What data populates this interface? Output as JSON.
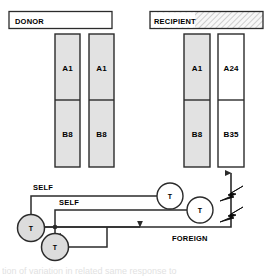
{
  "figure": {
    "type": "immunology-diagram",
    "title_donor": "DONOR",
    "title_recipient": "RECIPIENT",
    "caption_partial": "tion of variation in related same  response  to"
  },
  "panels": [
    {
      "id": "donor",
      "header": "DONOR",
      "header_fill": "#ffffff",
      "header_hatched": false,
      "columns": [
        {
          "id": "donor-col-1",
          "top_label": "A1",
          "bottom_label": "B8",
          "fill": "#e2e2e2"
        },
        {
          "id": "donor-col-2",
          "top_label": "A1",
          "bottom_label": "B8",
          "fill": "#e2e2e2"
        }
      ]
    },
    {
      "id": "recipient",
      "header": "RECIPIENT",
      "header_fill": "#f2f2f2",
      "header_hatched": true,
      "columns": [
        {
          "id": "recipient-col-1",
          "top_label": "A1",
          "bottom_label": "B8",
          "fill": "#e2e2e2"
        },
        {
          "id": "recipient-col-2",
          "top_label": "A24",
          "bottom_label": "B35",
          "fill": "#ffffff"
        }
      ]
    }
  ],
  "tcells": [
    {
      "id": "tcell-upper-right",
      "label": "T",
      "fill": "#ffffff"
    },
    {
      "id": "tcell-mid-right",
      "label": "T",
      "fill": "#ffffff"
    },
    {
      "id": "tcell-left-upper",
      "label": "T",
      "fill": "#dcdcdc"
    },
    {
      "id": "tcell-left-lower",
      "label": "T",
      "fill": "#dcdcdc"
    }
  ],
  "flow_labels": [
    {
      "id": "label-self-1",
      "text": "SELF"
    },
    {
      "id": "label-self-2",
      "text": "SELF"
    },
    {
      "id": "label-foreign",
      "text": "FOREIGN"
    }
  ],
  "colors": {
    "stroke": "#2b2b2b",
    "cell_fill": "#e2e2e2",
    "tcell_fill": "#dcdcdc",
    "white": "#ffffff",
    "hatch": "#b8b8b8"
  }
}
